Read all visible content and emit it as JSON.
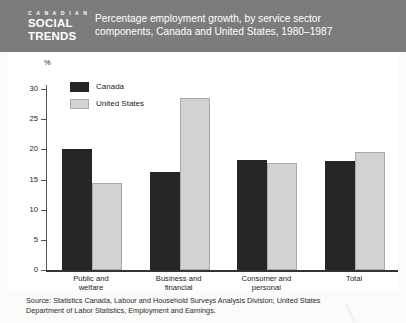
{
  "header": {
    "brand_top": "C A N A D I A N",
    "brand_line1": "SOCIAL",
    "brand_line2": "TRENDS",
    "title_line1": "Percentage employment growth, by service sector",
    "title_line2": "components, Canada and United States, 1980–1987",
    "band_color": "#7c7c7c"
  },
  "source": {
    "line1": "Source: Statistics Canada, Labour and Household Surveys Analysis Division;  United States",
    "line2": "Department of Labor Statistics, Employment and Earnings."
  },
  "chart_data": {
    "type": "bar",
    "title": "Percentage employment growth, by service sector components, Canada and United States, 1980–1987",
    "xlabel": "",
    "ylabel": "%",
    "ylim": [
      0,
      30
    ],
    "yticks": [
      0,
      5,
      10,
      15,
      20,
      25,
      30
    ],
    "ytick_labels": [
      "0",
      "5",
      "10",
      "15",
      "20",
      "25",
      "30"
    ],
    "grid": false,
    "legend_position": "upper-left-inside",
    "categories": [
      "Public and welfare",
      "Business and financial",
      "Consumer and personal",
      "Total"
    ],
    "category_lines": [
      [
        "Public and",
        "welfare"
      ],
      [
        "Business and",
        "financial"
      ],
      [
        "Consumer and",
        "personal"
      ],
      [
        "Total",
        ""
      ]
    ],
    "series": [
      {
        "name": "Canada",
        "color": "#262626",
        "values": [
          20.0,
          16.2,
          18.3,
          18.0
        ]
      },
      {
        "name": "United States",
        "color": "#d2d2d2",
        "values": [
          14.5,
          28.5,
          17.8,
          19.6
        ]
      }
    ]
  }
}
